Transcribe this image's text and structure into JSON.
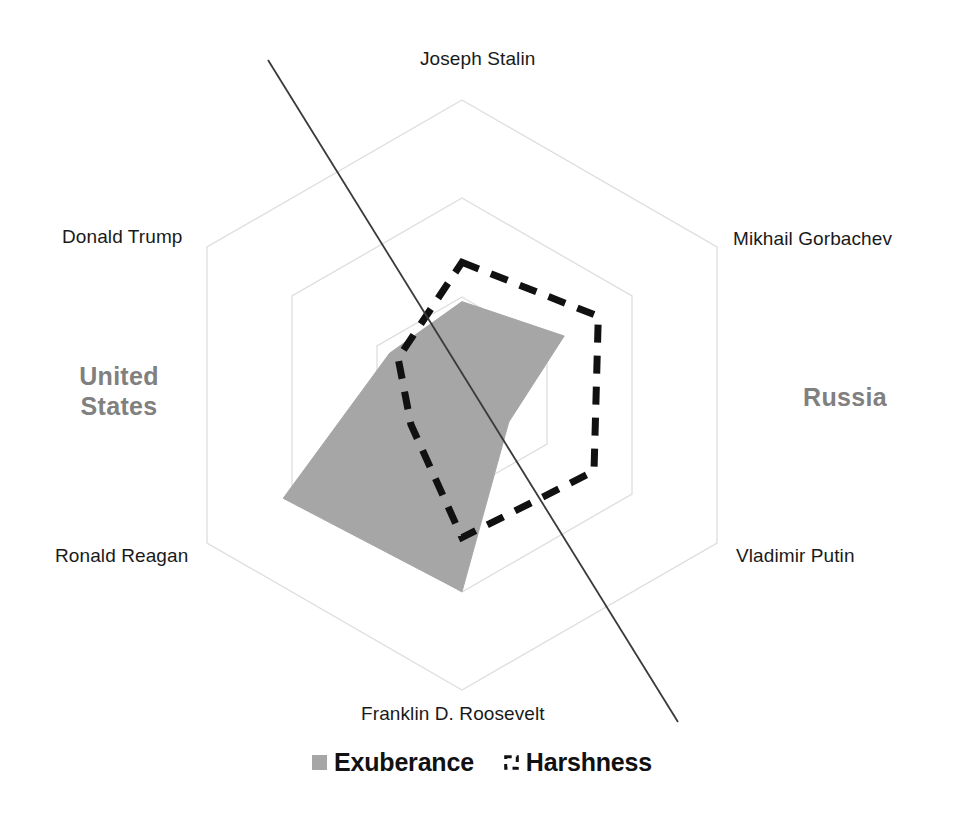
{
  "chart_data": {
    "type": "radar",
    "title": "",
    "categories": [
      "Joseph Stalin",
      "Mikhail Gorbachev",
      "Vladimir Putin",
      "Franklin D. Roosevelt",
      "Ronald Reagan",
      "Donald Trump"
    ],
    "rings": 3,
    "max": 3,
    "grid": true,
    "legend_position": "bottom",
    "series": [
      {
        "name": "Exuberance",
        "style": "filled",
        "color": "#a6a6a6",
        "values": [
          0.95,
          1.2,
          0.55,
          2.0,
          2.1,
          0.85
        ]
      },
      {
        "name": "Harshness",
        "style": "dashed-outline",
        "color": "#111111",
        "values": [
          1.35,
          1.6,
          1.55,
          1.45,
          0.6,
          0.75
        ]
      }
    ],
    "annotations": [
      {
        "name": "United States",
        "side": "left"
      },
      {
        "name": "Russia",
        "side": "right"
      }
    ]
  },
  "axis_labels": [
    {
      "id": "joseph-stalin",
      "text": "Joseph Stalin"
    },
    {
      "id": "mikhail-gorbachev",
      "text": "Mikhail Gorbachev"
    },
    {
      "id": "vladimir-putin",
      "text": "Vladimir Putin"
    },
    {
      "id": "franklin-d-roosevelt",
      "text": "Franklin D. Roosevelt"
    },
    {
      "id": "ronald-reagan",
      "text": "Ronald Reagan"
    },
    {
      "id": "donald-trump",
      "text": "Donald Trump"
    }
  ],
  "regions": {
    "left": {
      "line1": "United",
      "line2": "States",
      "full": "United States"
    },
    "right": {
      "line1": "Russia",
      "line2": "",
      "full": "Russia"
    }
  },
  "legend": {
    "exuberance": "Exuberance",
    "harshness": "Harshness"
  },
  "colors": {
    "fill_series": "#a6a6a6",
    "outline_series": "#111111",
    "grid": "#d9d9d9",
    "divider": "#3a3a3a",
    "axis_text": "#1a1a1a",
    "region_text": "#808080",
    "background": "#ffffff"
  }
}
